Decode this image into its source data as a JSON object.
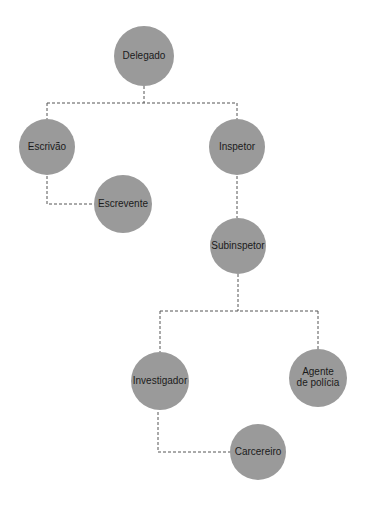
{
  "diagram": {
    "type": "org-chart",
    "colors": {
      "node": "#9a9a9a",
      "text": "#1a1a1a",
      "connector": "#555555"
    },
    "nodes": [
      {
        "id": "delegado",
        "lines": [
          "Delegado"
        ],
        "cx": 144,
        "cy": 56,
        "r": 30
      },
      {
        "id": "escrivao",
        "lines": [
          "Escrivão"
        ],
        "cx": 47,
        "cy": 147,
        "r": 28
      },
      {
        "id": "inspetor",
        "lines": [
          "Inspetor"
        ],
        "cx": 237,
        "cy": 147,
        "r": 28
      },
      {
        "id": "escrevente",
        "lines": [
          "Escrevente"
        ],
        "cx": 123,
        "cy": 204,
        "r": 29
      },
      {
        "id": "subinspetor",
        "lines": [
          "Subinspetor"
        ],
        "cx": 238,
        "cy": 246,
        "r": 28
      },
      {
        "id": "investigador",
        "lines": [
          "Investigador"
        ],
        "cx": 160,
        "cy": 381,
        "r": 29
      },
      {
        "id": "agente",
        "lines": [
          "Agente",
          "de polícia"
        ],
        "cx": 318,
        "cy": 378,
        "r": 29
      },
      {
        "id": "carcereiro",
        "lines": [
          "Carcereiro"
        ],
        "cx": 258,
        "cy": 452,
        "r": 28
      }
    ],
    "edges": [
      {
        "from": "Delegado",
        "to": "Escrivão"
      },
      {
        "from": "Delegado",
        "to": "Inspetor"
      },
      {
        "from": "Escrivão",
        "to": "Escrevente"
      },
      {
        "from": "Inspetor",
        "to": "Subinspetor"
      },
      {
        "from": "Subinspetor",
        "to": "Investigador"
      },
      {
        "from": "Subinspetor",
        "to": "Agente de polícia"
      },
      {
        "from": "Investigador",
        "to": "Carcereiro"
      }
    ]
  }
}
